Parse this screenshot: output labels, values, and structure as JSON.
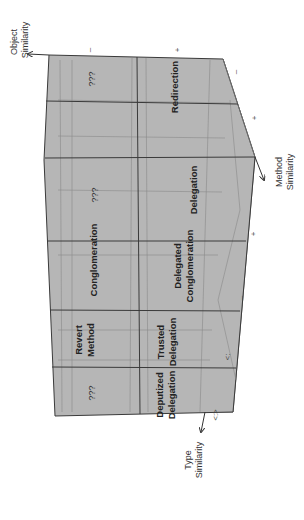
{
  "diagram": {
    "axes": {
      "object": {
        "line1": "Object",
        "line2": "Similarity"
      },
      "method": {
        "line1": "Method",
        "line2": "Similarity"
      },
      "type": {
        "line1": "Type",
        "line2": "Similarity"
      }
    },
    "ticks": {
      "top_1": "–",
      "top_2": "+",
      "right_1": "–",
      "right_2": "+",
      "right_3": "+",
      "right_4": "–",
      "right_5": "<:",
      "bottom": "<:>"
    },
    "cells": {
      "c_left_1": "???",
      "c_right_1": "Redirection",
      "c_left_2": "???",
      "c_right_2": "Delegation",
      "c_left_3": "Conglomeration",
      "c_right_3a": "Delegated",
      "c_right_3b": "Conglomeration",
      "c_left_4a": "Revert",
      "c_left_4b": "Method",
      "c_right_4a": "Trusted",
      "c_right_4b": "Delegation",
      "c_left_5": "???",
      "c_right_5a": "Deputized",
      "c_right_5b": "Delegation"
    },
    "colors": {
      "face": "#b4b4b4",
      "side": "#a2a2a2",
      "edge": "#3a3a3a",
      "grid": "#7a7a7a"
    }
  }
}
